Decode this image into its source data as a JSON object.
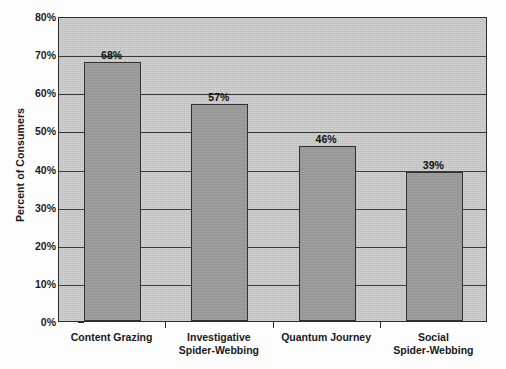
{
  "chart_data": {
    "type": "bar",
    "title": "",
    "xlabel": "",
    "ylabel": "Percent of Consumers",
    "ylim": [
      0,
      80
    ],
    "grid": true,
    "legend": "none",
    "categories": [
      "Content Grazing",
      "Investigative Spider-Webbing",
      "Quantum Journey",
      "Social Spider-Webbing"
    ],
    "category_lines": [
      [
        "Content Grazing",
        ""
      ],
      [
        "Investigative",
        "Spider-Webbing"
      ],
      [
        "Quantum Journey",
        ""
      ],
      [
        "Social",
        "Spider-Webbing"
      ]
    ],
    "values": [
      68,
      57,
      46,
      39
    ],
    "value_labels": [
      "68%",
      "57%",
      "46%",
      "39%"
    ],
    "y_ticks": [
      0,
      10,
      20,
      30,
      40,
      50,
      60,
      70,
      80
    ],
    "y_tick_labels": [
      "0%",
      "10%",
      "20%",
      "30%",
      "40%",
      "50%",
      "60%",
      "70%",
      "80%"
    ],
    "colors": {
      "bar_fill": "#9a9a9a",
      "bar_border": "#303030",
      "plot_background": "#c9c9c9",
      "gridline": "#3a3a3a",
      "axis": "#2b2b2b",
      "text": "#1a1a1a",
      "page_background": "#ffffff"
    }
  }
}
